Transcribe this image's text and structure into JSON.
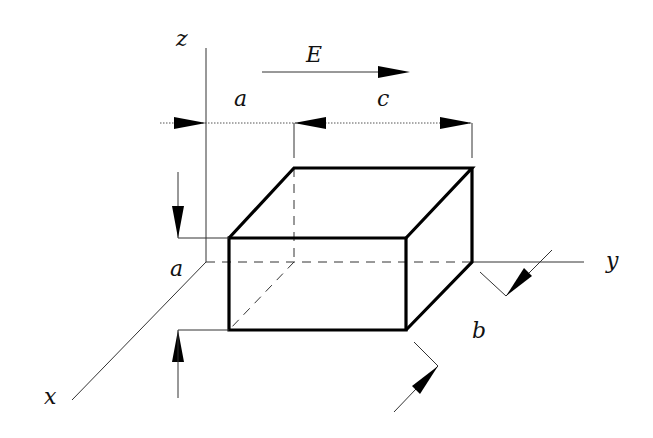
{
  "diagram": {
    "title": "",
    "colors": {
      "background": "#ffffff",
      "line": "#000000"
    },
    "labels": {
      "z_axis": "z",
      "y_axis": "y",
      "x_axis": "x",
      "field": "E",
      "dim_a_top": "a",
      "dim_c": "c",
      "dim_a_side": "a",
      "dim_b": "b"
    }
  }
}
